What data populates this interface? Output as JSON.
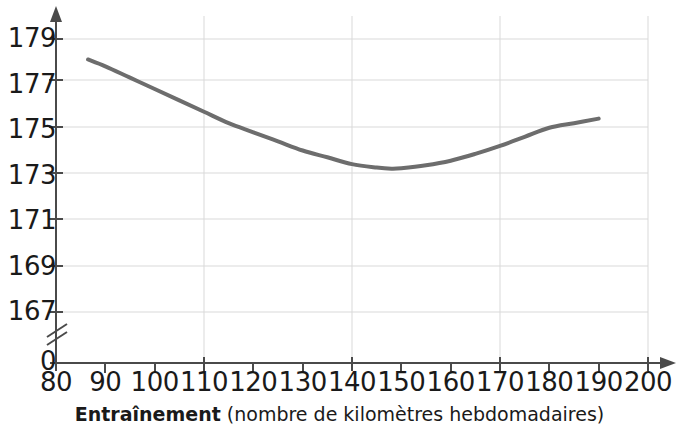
{
  "chart_data": {
    "type": "line",
    "title": "",
    "xlabel_strong": "Entraînement",
    "xlabel_rest": " (nombre de kilomètres hebdomadaires)",
    "ylabel": "",
    "xlim": [
      80,
      200
    ],
    "ylim": [
      166,
      180
    ],
    "y_axis_break": true,
    "y_axis_zero_label": "0",
    "grid": true,
    "grid_color": "#d9d9d9",
    "legend": "none",
    "xticks": [
      80,
      90,
      100,
      110,
      120,
      130,
      140,
      150,
      160,
      170,
      180,
      190,
      200
    ],
    "xtick_labels": [
      "80",
      "90",
      "100",
      "110",
      "120",
      "130",
      "140",
      "150",
      "160",
      "170",
      "180",
      "190",
      "200"
    ],
    "x_gridlines": [
      80,
      110,
      140,
      170,
      200
    ],
    "yticks": [
      167,
      169,
      171,
      173,
      175,
      177,
      179
    ],
    "ytick_labels": [
      "167",
      "169",
      "171",
      "173",
      "175",
      "177",
      "179"
    ],
    "series": [
      {
        "name": "courbe",
        "color": "#6d6d6d",
        "line_width": 4,
        "x": [
          86.5,
          90,
          95,
          100,
          105,
          110,
          115,
          120,
          125,
          130,
          135,
          140,
          145,
          148,
          150,
          155,
          160,
          165,
          170,
          175,
          180,
          185,
          190
        ],
        "y": [
          178.1,
          177.8,
          177.3,
          176.8,
          176.3,
          175.8,
          175.3,
          174.9,
          174.5,
          174.1,
          173.8,
          173.5,
          173.35,
          173.3,
          173.32,
          173.45,
          173.65,
          173.95,
          174.3,
          174.7,
          175.1,
          175.3,
          175.5
        ]
      }
    ],
    "annotations": []
  },
  "axes": {
    "x_axis_name": "x-axis",
    "y_axis_name": "y-axis",
    "x_arrow": true,
    "y_arrow": true,
    "break_symbol": "double-slash"
  },
  "top_clipped_text": ""
}
